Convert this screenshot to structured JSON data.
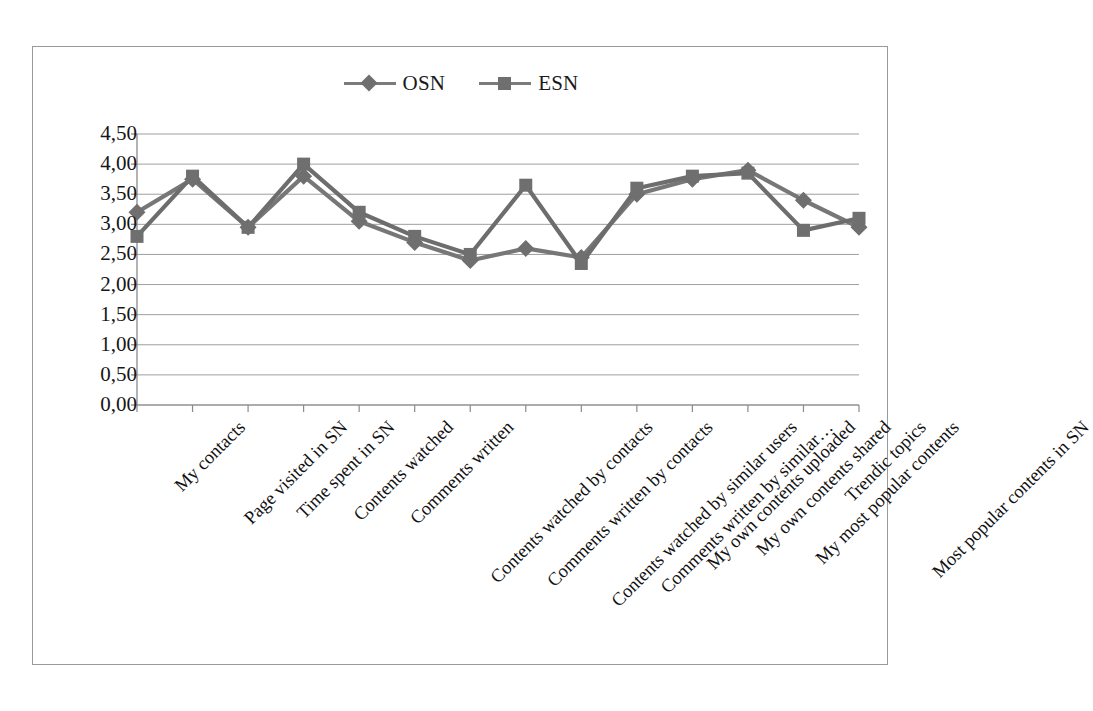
{
  "chart_data": {
    "type": "line",
    "title": "",
    "subtitle": "",
    "xlabel": "",
    "ylabel": "",
    "ylim": [
      0,
      4.5
    ],
    "y_tick_step": 0.5,
    "decimal_separator": ",",
    "grid": "horizontal",
    "legend_position": "top-center",
    "y_ticks": [
      "4,50",
      "4,00",
      "3,50",
      "3,00",
      "2,50",
      "2,00",
      "1,50",
      "1,00",
      "0,50",
      "0,00"
    ],
    "y_tick_values": [
      4.5,
      4.0,
      3.5,
      3.0,
      2.5,
      2.0,
      1.5,
      1.0,
      0.5,
      0.0
    ],
    "categories": [
      "My contacts",
      "Page visited in SN",
      "Time spent in SN",
      "Contents watched",
      "Comments written",
      "Contents watched by contacts",
      "Comments written by contacts",
      "Contents watched by similar users",
      "Comments written by similar…",
      "My own contents uploaded",
      "My own contents shared",
      "My most popular contents",
      "Trendic topics",
      "Most popular contents in SN"
    ],
    "series": [
      {
        "name": "OSN",
        "marker": "diamond",
        "color": "#777777",
        "values": [
          3.2,
          3.75,
          2.95,
          3.8,
          3.05,
          2.7,
          2.4,
          2.6,
          2.45,
          3.5,
          3.75,
          3.9,
          3.4,
          2.95
        ]
      },
      {
        "name": "ESN",
        "marker": "square",
        "color": "#6d6d6d",
        "values": [
          2.8,
          3.8,
          2.95,
          4.0,
          3.2,
          2.8,
          2.5,
          3.65,
          2.35,
          3.6,
          3.8,
          3.85,
          2.9,
          3.1
        ]
      }
    ]
  },
  "legend": {
    "entries": [
      {
        "label": "OSN",
        "marker": "diamond-marker-icon"
      },
      {
        "label": "ESN",
        "marker": "square-marker-icon"
      }
    ]
  },
  "colors": {
    "series_line": "#7b7b7b",
    "marker": "#6f6f6f",
    "gridline": "#9f9f9f",
    "axis": "#8a8a8a",
    "frame": "#9a9a9a",
    "text": "#161616",
    "background": "#ffffff"
  }
}
